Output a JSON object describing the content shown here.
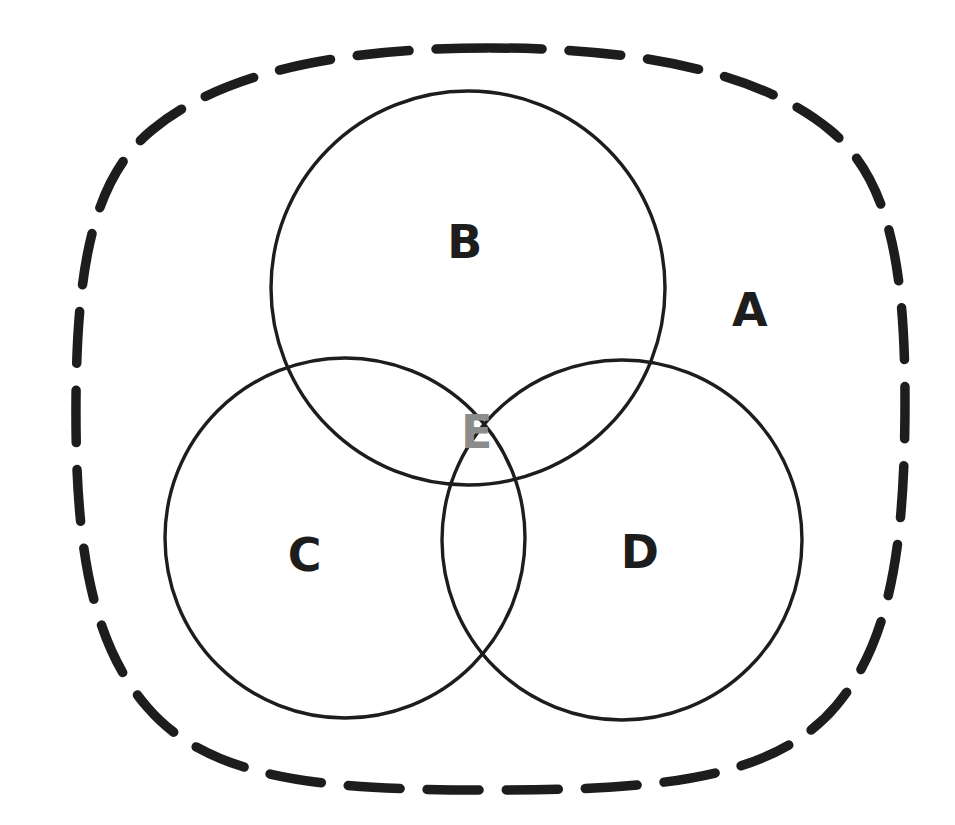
{
  "diagram": {
    "type": "venn-euler-diagram",
    "background_color": "#ffffff",
    "ink_color": "#1d1d1d",
    "gray_ink_color": "#8c8c8c",
    "canvas": {
      "width": 955,
      "height": 825
    }
  },
  "universal_set": {
    "label": "A",
    "label_x": 750,
    "label_y": 313,
    "label_color": "#1d1d1d",
    "shape": "rounded-blob",
    "stroke_style": "dashed",
    "stroke_width": 9,
    "dash_length": 52,
    "dash_gap": 26,
    "bounds": {
      "left": 75,
      "top": 48,
      "right": 905,
      "bottom": 790
    }
  },
  "circles": [
    {
      "label": "B",
      "position": "top",
      "cx": 468,
      "cy": 288,
      "r": 197,
      "stroke_style": "solid",
      "stroke_width": 3.4,
      "label_x": 465,
      "label_y": 245,
      "label_color": "#1d1d1d"
    },
    {
      "label": "C",
      "position": "bottom-left",
      "cx": 345,
      "cy": 538,
      "r": 180,
      "stroke_style": "solid",
      "stroke_width": 3.4,
      "label_x": 305,
      "label_y": 558,
      "label_color": "#1d1d1d"
    },
    {
      "label": "D",
      "position": "bottom-right",
      "cx": 622,
      "cy": 540,
      "r": 180,
      "stroke_style": "solid",
      "stroke_width": 3.4,
      "label_x": 640,
      "label_y": 555,
      "label_color": "#1d1d1d"
    }
  ],
  "intersection": {
    "label": "E",
    "description": "central triple-overlap region of circles B, C and D",
    "label_x": 477,
    "label_y": 435,
    "label_color": "#8c8c8c"
  },
  "labels": {
    "a": "A",
    "b": "B",
    "c": "C",
    "d": "D",
    "e": "E"
  }
}
